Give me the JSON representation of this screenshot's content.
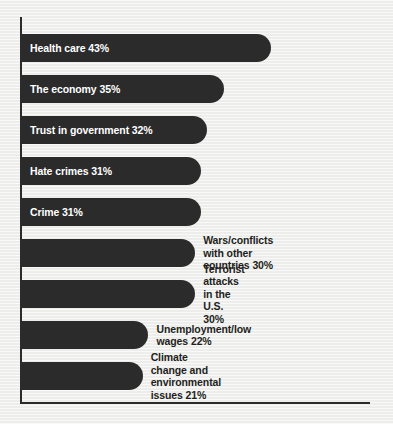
{
  "chart_data": {
    "type": "bar",
    "orientation": "horizontal",
    "title": "",
    "xlabel": "",
    "ylabel": "",
    "xlim": [
      0,
      43
    ],
    "grid": false,
    "legend": null,
    "value_suffix": "%",
    "categories": [
      "Health care",
      "The economy",
      "Trust in government",
      "Hate crimes",
      "Crime",
      "Wars/conflicts with other countries",
      "Terrorist attacks in the U.S.",
      "Unemployment/low wages",
      "Climate change and environmental issues"
    ],
    "values": [
      43,
      35,
      32,
      31,
      31,
      30,
      30,
      22,
      21
    ],
    "bars": [
      {
        "label": "Health care",
        "value": 43,
        "value_label": "43%",
        "label_position": "inside",
        "lines": [
          "Health care"
        ]
      },
      {
        "label": "The economy",
        "value": 35,
        "value_label": "35%",
        "label_position": "inside",
        "lines": [
          "The economy"
        ]
      },
      {
        "label": "Trust in government",
        "value": 32,
        "value_label": "32%",
        "label_position": "inside",
        "lines": [
          "Trust in government"
        ]
      },
      {
        "label": "Hate crimes",
        "value": 31,
        "value_label": "31%",
        "label_position": "inside",
        "lines": [
          "Hate crimes"
        ]
      },
      {
        "label": "Crime",
        "value": 31,
        "value_label": "31%",
        "label_position": "inside",
        "lines": [
          "Crime"
        ]
      },
      {
        "label": "Wars/conflicts with other countries",
        "value": 30,
        "value_label": "30%",
        "label_position": "outside",
        "lines": [
          "Wars/conflicts with other",
          "countries"
        ]
      },
      {
        "label": "Terrorist attacks in the U.S.",
        "value": 30,
        "value_label": "30%",
        "label_position": "outside",
        "lines": [
          "Terrorist attacks in the U.S."
        ]
      },
      {
        "label": "Unemployment/low wages",
        "value": 22,
        "value_label": "22%",
        "label_position": "outside",
        "lines": [
          "Unemployment/low wages"
        ]
      },
      {
        "label": "Climate change and environmental issues",
        "value": 21,
        "value_label": "21%",
        "label_position": "outside",
        "lines": [
          "Climate change and environmental",
          "issues"
        ]
      }
    ]
  },
  "style": {
    "background_color": "#f2f2f1",
    "bar_color": "#2b2b2b",
    "axis_color": "#2b2b2b",
    "inside_label_color": "#ffffff",
    "outside_label_color": "#231f20"
  }
}
